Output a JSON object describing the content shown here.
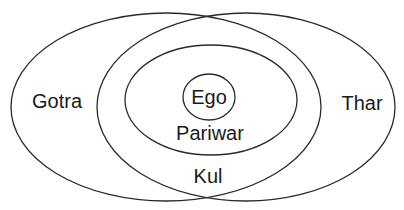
{
  "diagram": {
    "type": "nested-ellipses",
    "stroke_color": "#2a2a2a",
    "background": "#ffffff",
    "regions": [
      {
        "id": "gotra",
        "label": "Gotra"
      },
      {
        "id": "thar",
        "label": "Thar"
      },
      {
        "id": "pariwar",
        "label": "Pariwar"
      },
      {
        "id": "ego",
        "label": "Ego"
      },
      {
        "id": "kul",
        "label": "Kul"
      }
    ]
  }
}
